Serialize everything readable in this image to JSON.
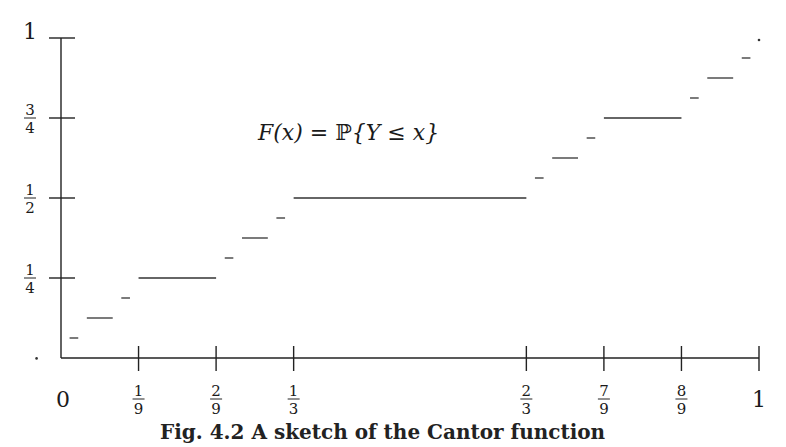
{
  "chart_data": {
    "type": "line",
    "subtype": "step",
    "title": "",
    "annotation": "F(x) = ℙ{Y ≤ x}",
    "xlabel": "",
    "ylabel": "",
    "xlim": [
      0,
      1
    ],
    "ylim": [
      0,
      1
    ],
    "grid": false,
    "legend": null,
    "x_ticks": [
      {
        "value": 0,
        "label": "0"
      },
      {
        "value": 0.1111,
        "label": "1/9"
      },
      {
        "value": 0.2222,
        "label": "2/9"
      },
      {
        "value": 0.3333,
        "label": "1/3"
      },
      {
        "value": 0.6667,
        "label": "2/3"
      },
      {
        "value": 0.7778,
        "label": "7/9"
      },
      {
        "value": 0.8889,
        "label": "8/9"
      },
      {
        "value": 1,
        "label": "1"
      }
    ],
    "y_ticks": [
      {
        "value": 0.25,
        "label": "1/4"
      },
      {
        "value": 0.5,
        "label": "1/2"
      },
      {
        "value": 0.75,
        "label": "3/4"
      },
      {
        "value": 1,
        "label": "1"
      }
    ],
    "series": [
      {
        "name": "F(x)",
        "segments": [
          {
            "x0": 0.0123,
            "x1": 0.0247,
            "y": 0.0625
          },
          {
            "x0": 0.037,
            "x1": 0.0741,
            "y": 0.125
          },
          {
            "x0": 0.0864,
            "x1": 0.0988,
            "y": 0.1875
          },
          {
            "x0": 0.1111,
            "x1": 0.2222,
            "y": 0.25
          },
          {
            "x0": 0.2346,
            "x1": 0.2469,
            "y": 0.3125
          },
          {
            "x0": 0.2593,
            "x1": 0.2963,
            "y": 0.375
          },
          {
            "x0": 0.3086,
            "x1": 0.321,
            "y": 0.4375
          },
          {
            "x0": 0.3333,
            "x1": 0.6667,
            "y": 0.5
          },
          {
            "x0": 0.679,
            "x1": 0.6914,
            "y": 0.5625
          },
          {
            "x0": 0.7037,
            "x1": 0.7407,
            "y": 0.625
          },
          {
            "x0": 0.7531,
            "x1": 0.7654,
            "y": 0.6875
          },
          {
            "x0": 0.7778,
            "x1": 0.8889,
            "y": 0.75
          },
          {
            "x0": 0.9012,
            "x1": 0.9136,
            "y": 0.8125
          },
          {
            "x0": 0.9259,
            "x1": 0.963,
            "y": 0.875
          },
          {
            "x0": 0.9753,
            "x1": 0.9877,
            "y": 0.9375
          }
        ],
        "points": [
          {
            "x": -0.035,
            "y": 0.005
          },
          {
            "x": 1.0,
            "y": 1.0
          }
        ]
      }
    ]
  },
  "figure": {
    "annotation_parts": {
      "lhs": "F(x) = ",
      "prob": "ℙ",
      "rhs": "{Y ≤ x}"
    },
    "caption": "Fig. 4.2  A sketch of the Cantor function"
  }
}
